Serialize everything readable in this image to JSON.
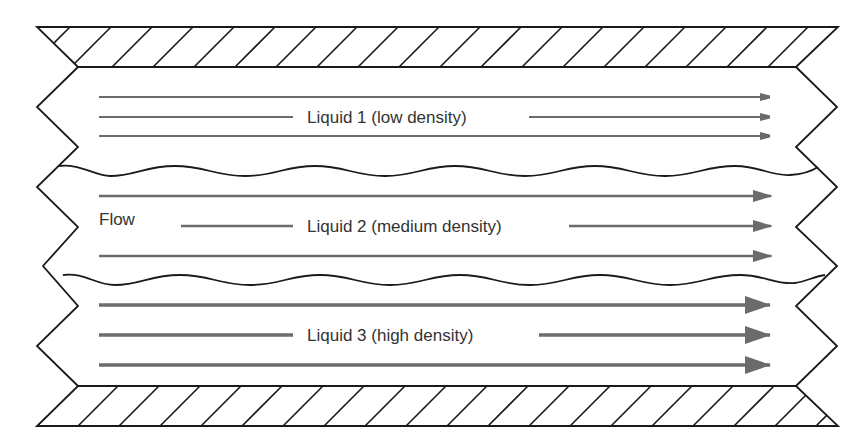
{
  "diagram": {
    "flow_label": "Flow",
    "layers": [
      {
        "name": "Liquid 1 (low density)",
        "arrow_weight": "thin"
      },
      {
        "name": "Liquid 2 (medium density)",
        "arrow_weight": "medium"
      },
      {
        "name": "Liquid 3 (high density)",
        "arrow_weight": "thick"
      }
    ],
    "walls": {
      "top": "hatched solid wall",
      "bottom": "hatched solid wall"
    },
    "interfaces": [
      "wavy interface 1-2",
      "wavy interface 2-3"
    ],
    "colors": {
      "outline": "#1a1a1a",
      "arrow": "#6b6b6b",
      "text": "#333333",
      "background": "#ffffff"
    }
  }
}
